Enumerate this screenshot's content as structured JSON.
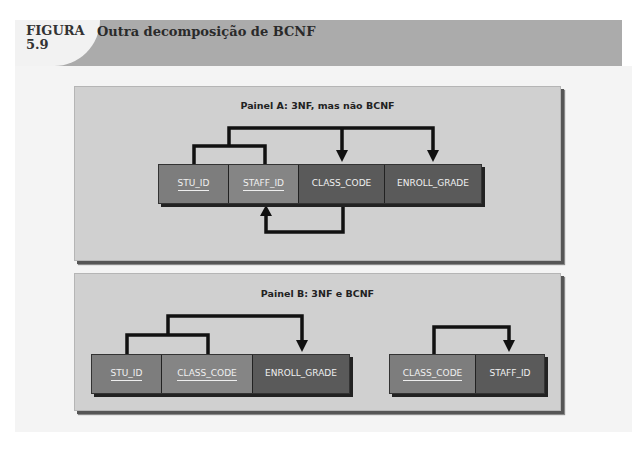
{
  "figure": {
    "label_line1": "FIGURA",
    "label_line2": "5.9",
    "title": "Outra decomposição de BCNF"
  },
  "panel_a": {
    "title": "Painel A: 3NF, mas não BCNF",
    "table": {
      "columns": [
        {
          "name": "STU_ID",
          "primary_key": true
        },
        {
          "name": "STAFF_ID",
          "primary_key": true
        },
        {
          "name": "CLASS_CODE",
          "primary_key": false
        },
        {
          "name": "ENROLL_GRADE",
          "primary_key": false
        }
      ]
    },
    "dependencies": [
      {
        "from": [
          "STU_ID",
          "STAFF_ID"
        ],
        "to": [
          "CLASS_CODE",
          "ENROLL_GRADE"
        ]
      },
      {
        "from": [
          "CLASS_CODE"
        ],
        "to": [
          "STAFF_ID"
        ]
      }
    ]
  },
  "panel_b": {
    "title": "Painel B: 3NF e BCNF",
    "tables": [
      {
        "columns": [
          {
            "name": "STU_ID",
            "primary_key": true
          },
          {
            "name": "CLASS_CODE",
            "primary_key": true
          },
          {
            "name": "ENROLL_GRADE",
            "primary_key": false
          }
        ]
      },
      {
        "columns": [
          {
            "name": "CLASS_CODE",
            "primary_key": true
          },
          {
            "name": "STAFF_ID",
            "primary_key": false
          }
        ]
      }
    ],
    "dependencies": [
      {
        "from": [
          "STU_ID",
          "CLASS_CODE"
        ],
        "to": [
          "ENROLL_GRADE"
        ]
      },
      {
        "from": [
          "CLASS_CODE"
        ],
        "to": [
          "STAFF_ID"
        ]
      }
    ]
  },
  "colors": {
    "header_band": "#ababab",
    "panel_bg": "#d0d0d0",
    "key_cell": "#7d7d7d",
    "nonkey_cell": "#5a5a5a",
    "arrow": "#111111"
  }
}
